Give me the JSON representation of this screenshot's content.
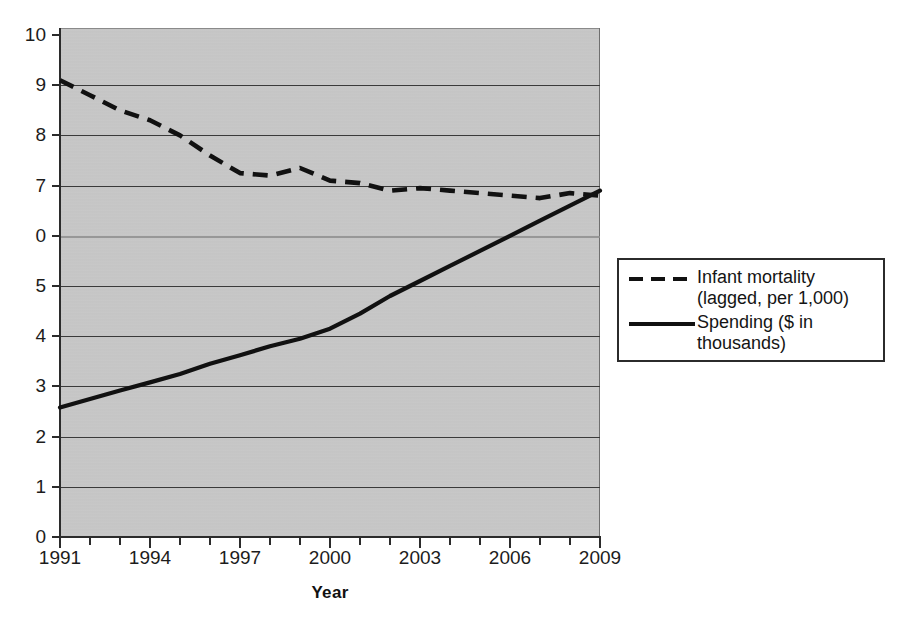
{
  "figure": {
    "background_color": "#ffffff",
    "plot_background_color": "#c9c9c9",
    "line_color": "#111111"
  },
  "axes": {
    "x_title": "Year",
    "y_title": "",
    "y_tick_labels": [
      "10",
      "9",
      "8",
      "7",
      "0",
      "5",
      "4",
      "3",
      "2",
      "1",
      "0"
    ],
    "x_tick_labels": [
      "1991",
      "1994",
      "1997",
      "2000",
      "2003",
      "2006",
      "2009"
    ]
  },
  "legend": {
    "items": [
      {
        "label": "Infant mortality\n(lagged, per 1,000)",
        "style": "dashed"
      },
      {
        "label": "Spending ($ in\nthousands)",
        "style": "solid"
      }
    ]
  },
  "chart_data": {
    "type": "line",
    "title": "",
    "xlabel": "Year",
    "ylabel": "",
    "xlim": [
      1991,
      2009
    ],
    "ylim": [
      0,
      10
    ],
    "grid": true,
    "legend_position": "right",
    "x": [
      1991,
      1992,
      1993,
      1994,
      1995,
      1996,
      1997,
      1998,
      1999,
      2000,
      2001,
      2002,
      2003,
      2004,
      2005,
      2006,
      2007,
      2008,
      2009
    ],
    "series": [
      {
        "name": "Infant mortality (lagged, per 1,000)",
        "style": "dashed",
        "values": [
          9.1,
          8.8,
          8.5,
          8.3,
          8.0,
          7.6,
          7.25,
          7.2,
          7.35,
          7.1,
          7.05,
          6.9,
          6.95,
          6.9,
          6.85,
          6.8,
          6.75,
          6.85,
          6.8
        ]
      },
      {
        "name": "Spending ($ in thousands)",
        "style": "solid",
        "values": [
          2.58,
          2.75,
          2.92,
          3.08,
          3.25,
          3.45,
          3.62,
          3.8,
          3.95,
          4.15,
          4.45,
          4.8,
          5.1,
          5.4,
          5.7,
          6.0,
          6.3,
          6.6,
          6.9
        ]
      }
    ]
  }
}
